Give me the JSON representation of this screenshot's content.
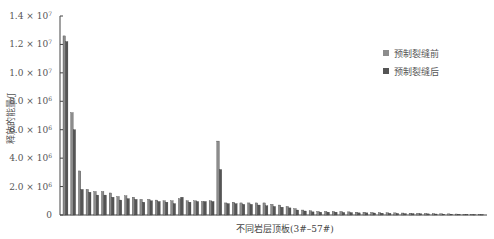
{
  "chart_data": {
    "type": "bar",
    "title": "",
    "xlabel": "不同岩层顶板(3#–57#)",
    "ylabel": "释放的能量/J",
    "ylim": [
      0,
      14000000
    ],
    "yticks": [
      {
        "value": 0,
        "label": "0"
      },
      {
        "value": 2000000,
        "label": "2.0 × 10",
        "exp": "6"
      },
      {
        "value": 4000000,
        "label": "4.0 × 10",
        "exp": "6"
      },
      {
        "value": 6000000,
        "label": "6.0 × 10",
        "exp": "6"
      },
      {
        "value": 8000000,
        "label": "8.0 × 10",
        "exp": "6"
      },
      {
        "value": 10000000,
        "label": "1.0 × 10",
        "exp": "7"
      },
      {
        "value": 12000000,
        "label": "1.2 × 10",
        "exp": "7"
      },
      {
        "value": 14000000,
        "label": "1.4 × 10",
        "exp": "7"
      }
    ],
    "grid": false,
    "legend_position": "upper right",
    "categories": [
      "3#",
      "4#",
      "5#",
      "6#",
      "7#",
      "8#",
      "9#",
      "10#",
      "11#",
      "12#",
      "13#",
      "14#",
      "15#",
      "16#",
      "17#",
      "18#",
      "19#",
      "20#",
      "21#",
      "22#",
      "23#",
      "24#",
      "25#",
      "26#",
      "27#",
      "28#",
      "29#",
      "30#",
      "31#",
      "32#",
      "33#",
      "34#",
      "35#",
      "36#",
      "37#",
      "38#",
      "39#",
      "40#",
      "41#",
      "42#",
      "43#",
      "44#",
      "45#",
      "46#",
      "47#",
      "48#",
      "49#",
      "50#",
      "51#",
      "52#",
      "53#",
      "54#",
      "55#",
      "56#",
      "57#"
    ],
    "series": [
      {
        "name": "预制裂缝前",
        "color": "#8c8c8c",
        "values": [
          12600000,
          7200000,
          3100000,
          1800000,
          1650000,
          1650000,
          1550000,
          1300000,
          1350000,
          1250000,
          1100000,
          1100000,
          1050000,
          1000000,
          1000000,
          1150000,
          1000000,
          1000000,
          950000,
          1000000,
          5200000,
          850000,
          900000,
          850000,
          850000,
          850000,
          850000,
          750000,
          700000,
          600000,
          450000,
          350000,
          300000,
          250000,
          250000,
          250000,
          250000,
          220000,
          200000,
          200000,
          180000,
          170000,
          160000,
          150000,
          140000,
          130000,
          120000,
          110000,
          100000,
          90000,
          80000,
          70000,
          60000,
          50000,
          40000
        ]
      },
      {
        "name": "预制裂缝后",
        "color": "#555555",
        "values": [
          12200000,
          6000000,
          1800000,
          1600000,
          1400000,
          1400000,
          1250000,
          1050000,
          1150000,
          1100000,
          900000,
          1000000,
          950000,
          900000,
          800000,
          1250000,
          900000,
          950000,
          950000,
          950000,
          3200000,
          800000,
          800000,
          750000,
          750000,
          700000,
          650000,
          600000,
          550000,
          500000,
          350000,
          280000,
          220000,
          200000,
          200000,
          200000,
          180000,
          170000,
          150000,
          150000,
          140000,
          130000,
          120000,
          110000,
          100000,
          100000,
          90000,
          80000,
          70000,
          60000,
          60000,
          50000,
          40000,
          30000,
          30000
        ]
      }
    ]
  },
  "legend": {
    "items": [
      {
        "label": "预制裂缝前",
        "color": "#8c8c8c"
      },
      {
        "label": "预制裂缝后",
        "color": "#555555"
      }
    ]
  },
  "axes": {
    "xlabel": "不同岩层顶板(3#–57#)",
    "ylabel": "释放的能量/J"
  }
}
